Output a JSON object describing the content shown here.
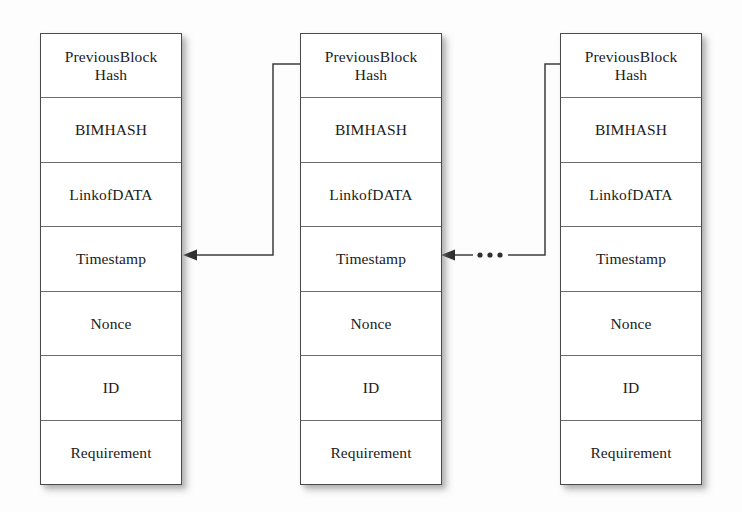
{
  "diagram": {
    "field_labels": [
      "PreviousBlock Hash",
      "BIMHASH",
      "LinkofDATA",
      "Timestamp",
      "Nonce",
      "ID",
      "Requirement"
    ],
    "blocks": [
      {
        "name": "block-1",
        "fields": {
          "previous_block_hash_line1": "PreviousBlock",
          "previous_block_hash_line2": "Hash",
          "bim_hash": "BIMHASH",
          "link_of_data": "LinkofDATA",
          "timestamp": "Timestamp",
          "nonce": "Nonce",
          "id": "ID",
          "requirement": "Requirement"
        }
      },
      {
        "name": "block-2",
        "fields": {
          "previous_block_hash_line1": "PreviousBlock",
          "previous_block_hash_line2": "Hash",
          "bim_hash": "BIMHASH",
          "link_of_data": "LinkofDATA",
          "timestamp": "Timestamp",
          "nonce": "Nonce",
          "id": "ID",
          "requirement": "Requirement"
        }
      },
      {
        "name": "block-3",
        "fields": {
          "previous_block_hash_line1": "PreviousBlock",
          "previous_block_hash_line2": "Hash",
          "bim_hash": "BIMHASH",
          "link_of_data": "LinkofDATA",
          "timestamp": "Timestamp",
          "nonce": "Nonce",
          "id": "ID",
          "requirement": "Requirement"
        }
      }
    ],
    "connectors": [
      {
        "name": "connector-block2-to-block1",
        "from": "block-2.previous-block-hash",
        "to": "block-1.timestamp",
        "style": "solid-elbow-with-arrowhead"
      },
      {
        "name": "connector-block3-to-block2",
        "from": "block-3.previous-block-hash",
        "to": "block-2.timestamp",
        "style": "solid-elbow-with-ellipsis-and-arrowhead"
      }
    ],
    "ellipsis": {
      "name": "chain-continuation-ellipsis",
      "symbol": "...",
      "dot_count": 3
    },
    "colors": {
      "block_border": "#4a4a4a",
      "field_divider": "#6e6e6e",
      "text": "#1b1b1b",
      "connector": "#3c3c3c",
      "background": "#fdfdfd",
      "shadow": "rgba(120,120,120,0.40)"
    }
  }
}
